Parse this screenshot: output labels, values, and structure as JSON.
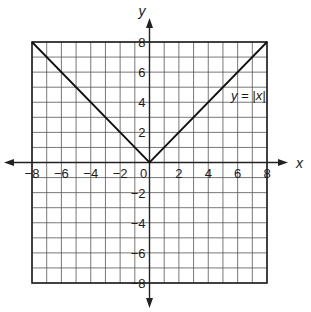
{
  "chart_data": {
    "type": "line",
    "title": "",
    "xlabel": "x",
    "ylabel": "y",
    "xlim": [
      -8,
      8
    ],
    "ylim": [
      -8,
      8
    ],
    "grid": true,
    "grid_step": 1,
    "x_ticks": [
      -8,
      -6,
      -4,
      -2,
      0,
      2,
      4,
      6,
      8
    ],
    "y_ticks": [
      -8,
      -6,
      -4,
      -2,
      2,
      4,
      6,
      8
    ],
    "x_tick_labels": [
      "−8",
      "−6",
      "−4",
      "−2",
      "0",
      "2",
      "4",
      "6",
      "8"
    ],
    "y_tick_labels": [
      "−8",
      "−6",
      "−4",
      "−2",
      "2",
      "4",
      "6",
      "8"
    ],
    "series": [
      {
        "name": "y = |x|",
        "x": [
          -8,
          0,
          8
        ],
        "y": [
          8,
          0,
          8
        ]
      }
    ],
    "annotations": [
      {
        "text": "y = |x|",
        "x": 6.8,
        "y": 4.5
      }
    ]
  },
  "labels": {
    "x_axis": "x",
    "y_axis": "y",
    "equation": "y = |x|"
  }
}
